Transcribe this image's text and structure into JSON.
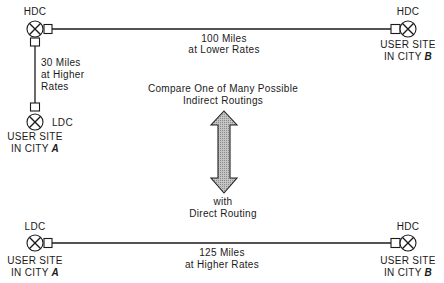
{
  "diagram": {
    "indirect": {
      "site_a": {
        "office": "LDC",
        "label_line1": "USER SITE",
        "label_line2_prefix": "IN CITY ",
        "label_line2_city": "A"
      },
      "hub": {
        "office": "HDC"
      },
      "site_b": {
        "office": "HDC",
        "label_line1": "USER SITE",
        "label_line2_prefix": "IN CITY ",
        "label_line2_city": "B"
      },
      "link_a_hub": {
        "line1": "30 Miles",
        "line2": "at Higher",
        "line3": "Rates"
      },
      "link_hub_b": {
        "line1": "100 Miles",
        "line2": "at Lower Rates"
      }
    },
    "comparison": {
      "top_line1": "Compare One of Many Possible",
      "top_line2": "Indirect Routings",
      "bottom_line1": "with",
      "bottom_line2": "Direct Routing",
      "arrow_icon": "double-headed-vertical-arrow"
    },
    "direct": {
      "site_a": {
        "office": "LDC",
        "label_line1": "USER SITE",
        "label_line2_prefix": "IN CITY ",
        "label_line2_city": "A"
      },
      "site_b": {
        "office": "HDC",
        "label_line1": "USER SITE",
        "label_line2_prefix": "IN CITY ",
        "label_line2_city": "B"
      },
      "link_a_b": {
        "line1": "125 Miles",
        "line2": "at Higher Rates"
      }
    },
    "colors": {
      "line": "#1a1a1a",
      "arrow_fill": "#b8b8b8",
      "background": "#ffffff"
    }
  }
}
